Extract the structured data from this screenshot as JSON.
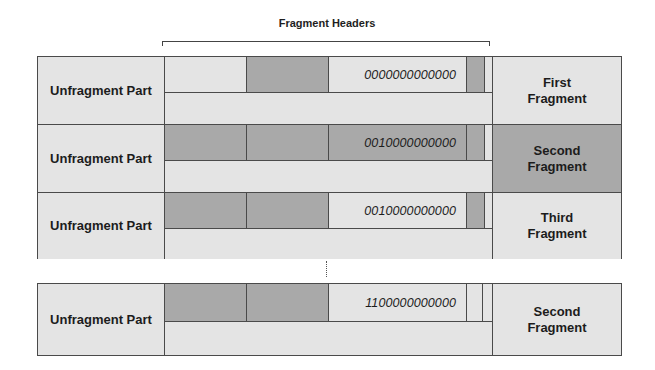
{
  "title": "Fragment Headers",
  "colors": {
    "light": "#e4e4e4",
    "dark": "#a9a9a9",
    "border": "#4a4a4a"
  },
  "rows": [
    {
      "left_label": "Unfragment Part",
      "segments": [
        "light",
        "dark",
        "light",
        "dark",
        "light"
      ],
      "offset": "0000000000000",
      "right_label": "First Fragment",
      "right_shade": "light"
    },
    {
      "left_label": "Unfragment Part",
      "segments": [
        "dark",
        "dark",
        "dark",
        "dark",
        "light"
      ],
      "offset": "0010000000000",
      "right_label": "Second Fragment",
      "right_shade": "dark"
    },
    {
      "left_label": "Unfragment Part",
      "segments": [
        "dark",
        "dark",
        "light",
        "dark",
        "light"
      ],
      "offset": "0010000000000",
      "right_label": "Third Fragment",
      "right_shade": "light"
    }
  ],
  "separator": "dotted-ellipsis",
  "bottom_row": {
    "left_label": "Unfragment Part",
    "segments": [
      "dark",
      "dark",
      "light",
      "light",
      "light"
    ],
    "offset": "1100000000000",
    "right_label": "Second Fragment",
    "right_shade": "light"
  }
}
